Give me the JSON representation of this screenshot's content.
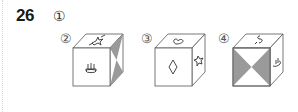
{
  "question": {
    "number": "26",
    "prompt_marker": "①"
  },
  "options": [
    {
      "label": "②",
      "top_symbol": "star-scribble",
      "front_symbol": "candle-cake",
      "right_face": "gray-hourglass-vertical"
    },
    {
      "label": "③",
      "top_symbol": "heart",
      "front_symbol": "diamond",
      "right_face": "star"
    },
    {
      "label": "④",
      "top_symbol": "s-curve",
      "front_symbol": "gray-bowtie-horizontal",
      "right_face": "hand-scribble"
    }
  ],
  "colors": {
    "line": "#555555",
    "shade": "#9a9a9a",
    "text": "#1a1a1a"
  }
}
